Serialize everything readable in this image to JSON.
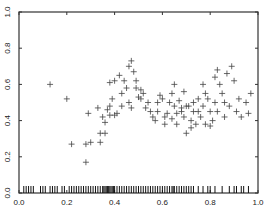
{
  "chart_data": {
    "type": "scatter",
    "title": "",
    "xlabel": "",
    "ylabel": "",
    "xlim": [
      0.0,
      1.0
    ],
    "ylim": [
      0.0,
      1.0
    ],
    "grid": false,
    "legend": null,
    "marker": "+",
    "x_ticks": [
      "0.0",
      "0.2",
      "0.4",
      "0.6",
      "0.8",
      "1.0"
    ],
    "y_ticks": [
      "0.0",
      "0.2",
      "0.4",
      "0.6",
      "0.8",
      "1.0"
    ],
    "points": [
      [
        0.13,
        0.6
      ],
      [
        0.2,
        0.52
      ],
      [
        0.22,
        0.27
      ],
      [
        0.28,
        0.17
      ],
      [
        0.28,
        0.27
      ],
      [
        0.29,
        0.44
      ],
      [
        0.3,
        0.28
      ],
      [
        0.33,
        0.47
      ],
      [
        0.34,
        0.33
      ],
      [
        0.34,
        0.28
      ],
      [
        0.35,
        0.42
      ],
      [
        0.36,
        0.33
      ],
      [
        0.36,
        0.39
      ],
      [
        0.37,
        0.46
      ],
      [
        0.38,
        0.43
      ],
      [
        0.38,
        0.48
      ],
      [
        0.38,
        0.61
      ],
      [
        0.39,
        0.52
      ],
      [
        0.4,
        0.43
      ],
      [
        0.4,
        0.62
      ],
      [
        0.41,
        0.44
      ],
      [
        0.42,
        0.65
      ],
      [
        0.43,
        0.55
      ],
      [
        0.43,
        0.48
      ],
      [
        0.44,
        0.62
      ],
      [
        0.45,
        0.58
      ],
      [
        0.46,
        0.7
      ],
      [
        0.46,
        0.5
      ],
      [
        0.47,
        0.73
      ],
      [
        0.47,
        0.47
      ],
      [
        0.48,
        0.67
      ],
      [
        0.49,
        0.62
      ],
      [
        0.49,
        0.58
      ],
      [
        0.5,
        0.53
      ],
      [
        0.51,
        0.57
      ],
      [
        0.51,
        0.52
      ],
      [
        0.52,
        0.55
      ],
      [
        0.53,
        0.47
      ],
      [
        0.54,
        0.5
      ],
      [
        0.55,
        0.45
      ],
      [
        0.56,
        0.42
      ],
      [
        0.57,
        0.4
      ],
      [
        0.58,
        0.45
      ],
      [
        0.58,
        0.5
      ],
      [
        0.59,
        0.54
      ],
      [
        0.6,
        0.52
      ],
      [
        0.61,
        0.38
      ],
      [
        0.61,
        0.42
      ],
      [
        0.62,
        0.44
      ],
      [
        0.63,
        0.5
      ],
      [
        0.64,
        0.41
      ],
      [
        0.64,
        0.55
      ],
      [
        0.65,
        0.6
      ],
      [
        0.65,
        0.48
      ],
      [
        0.66,
        0.44
      ],
      [
        0.66,
        0.38
      ],
      [
        0.67,
        0.51
      ],
      [
        0.68,
        0.47
      ],
      [
        0.68,
        0.45
      ],
      [
        0.69,
        0.56
      ],
      [
        0.69,
        0.42
      ],
      [
        0.7,
        0.48
      ],
      [
        0.7,
        0.33
      ],
      [
        0.71,
        0.48
      ],
      [
        0.72,
        0.36
      ],
      [
        0.72,
        0.4
      ],
      [
        0.73,
        0.45
      ],
      [
        0.73,
        0.5
      ],
      [
        0.74,
        0.38
      ],
      [
        0.75,
        0.45
      ],
      [
        0.75,
        0.52
      ],
      [
        0.76,
        0.42
      ],
      [
        0.77,
        0.6
      ],
      [
        0.77,
        0.48
      ],
      [
        0.78,
        0.55
      ],
      [
        0.78,
        0.38
      ],
      [
        0.79,
        0.52
      ],
      [
        0.8,
        0.45
      ],
      [
        0.8,
        0.37
      ],
      [
        0.81,
        0.4
      ],
      [
        0.82,
        0.64
      ],
      [
        0.82,
        0.5
      ],
      [
        0.83,
        0.68
      ],
      [
        0.83,
        0.45
      ],
      [
        0.84,
        0.6
      ],
      [
        0.85,
        0.55
      ],
      [
        0.86,
        0.5
      ],
      [
        0.86,
        0.42
      ],
      [
        0.87,
        0.66
      ],
      [
        0.88,
        0.48
      ],
      [
        0.89,
        0.7
      ],
      [
        0.9,
        0.62
      ],
      [
        0.91,
        0.45
      ],
      [
        0.92,
        0.52
      ],
      [
        0.93,
        0.42
      ],
      [
        0.95,
        0.5
      ],
      [
        0.97,
        0.55
      ],
      [
        0.96,
        0.44
      ]
    ],
    "rug": {
      "axis": "x",
      "positions": [
        0.02,
        0.03,
        0.04,
        0.05,
        0.06,
        0.09,
        0.1,
        0.11,
        0.13,
        0.14,
        0.15,
        0.16,
        0.18,
        0.19,
        0.21,
        0.22,
        0.23,
        0.24,
        0.25,
        0.26,
        0.27,
        0.28,
        0.29,
        0.3,
        0.31,
        0.32,
        0.33,
        0.34,
        0.35,
        0.355,
        0.36,
        0.365,
        0.37,
        0.375,
        0.38,
        0.385,
        0.39,
        0.395,
        0.4,
        0.41,
        0.42,
        0.43,
        0.44,
        0.45,
        0.46,
        0.47,
        0.48,
        0.49,
        0.5,
        0.51,
        0.52,
        0.53,
        0.54,
        0.55,
        0.56,
        0.57,
        0.58,
        0.59,
        0.6,
        0.61,
        0.62,
        0.63,
        0.64,
        0.645,
        0.65,
        0.66,
        0.67,
        0.68,
        0.69,
        0.7,
        0.71,
        0.72,
        0.73,
        0.75,
        0.77,
        0.79,
        0.8,
        0.82,
        0.85,
        0.88,
        0.9,
        0.91,
        0.93,
        0.94,
        0.96
      ]
    }
  },
  "colors": {
    "axis": "#333333",
    "marker": "#444444",
    "rug": "#111111",
    "background": "#ffffff"
  }
}
